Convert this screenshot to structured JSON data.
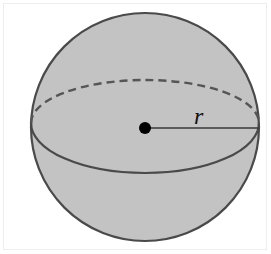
{
  "diagram": {
    "type": "sphere",
    "label_radius": "r",
    "colors": {
      "fill": "#c3c3c3",
      "stroke": "#4a4a4a",
      "center_dot": "#000000",
      "background": "#ffffff"
    },
    "geometry": {
      "center": [
        145,
        127
      ],
      "radius": 114,
      "equator_ry": 45
    }
  }
}
